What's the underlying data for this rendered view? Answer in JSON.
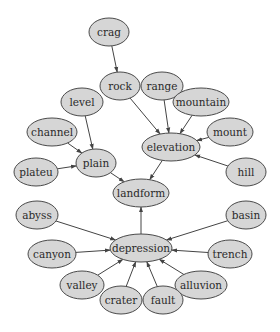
{
  "diagram": {
    "type": "directed-graph",
    "nodes": [
      {
        "id": "crag",
        "label": "crag",
        "x": 109,
        "y": 32,
        "rx": 20,
        "ry": 14
      },
      {
        "id": "rock",
        "label": "rock",
        "x": 120,
        "y": 86,
        "rx": 20,
        "ry": 14
      },
      {
        "id": "range",
        "label": "range",
        "x": 162,
        "y": 86,
        "rx": 21,
        "ry": 14
      },
      {
        "id": "mountain",
        "label": "mountain",
        "x": 201,
        "y": 102,
        "rx": 28,
        "ry": 14
      },
      {
        "id": "level",
        "label": "level",
        "x": 82,
        "y": 102,
        "rx": 21,
        "ry": 14
      },
      {
        "id": "channel",
        "label": "channel",
        "x": 52,
        "y": 132,
        "rx": 25,
        "ry": 14
      },
      {
        "id": "mount",
        "label": "mount",
        "x": 230,
        "y": 132,
        "rx": 23,
        "ry": 14
      },
      {
        "id": "elevation",
        "label": "elevation",
        "x": 171,
        "y": 147,
        "rx": 29,
        "ry": 14
      },
      {
        "id": "plain",
        "label": "plain",
        "x": 96,
        "y": 163,
        "rx": 20,
        "ry": 14
      },
      {
        "id": "plateu",
        "label": "plateu",
        "x": 36,
        "y": 172,
        "rx": 22,
        "ry": 14
      },
      {
        "id": "hill",
        "label": "hill",
        "x": 246,
        "y": 172,
        "rx": 20,
        "ry": 14
      },
      {
        "id": "landform",
        "label": "landform",
        "x": 141,
        "y": 193,
        "rx": 28,
        "ry": 14
      },
      {
        "id": "abyss",
        "label": "abyss",
        "x": 37,
        "y": 215,
        "rx": 21,
        "ry": 14
      },
      {
        "id": "basin",
        "label": "basin",
        "x": 246,
        "y": 215,
        "rx": 20,
        "ry": 14
      },
      {
        "id": "depression",
        "label": "depression",
        "x": 141,
        "y": 248,
        "rx": 31,
        "ry": 14
      },
      {
        "id": "canyon",
        "label": "canyon",
        "x": 52,
        "y": 254,
        "rx": 24,
        "ry": 14
      },
      {
        "id": "trench",
        "label": "trench",
        "x": 230,
        "y": 254,
        "rx": 22,
        "ry": 14
      },
      {
        "id": "valley",
        "label": "valley",
        "x": 82,
        "y": 285,
        "rx": 22,
        "ry": 14
      },
      {
        "id": "alluvion",
        "label": "alluvion",
        "x": 201,
        "y": 285,
        "rx": 26,
        "ry": 14
      },
      {
        "id": "crater",
        "label": "crater",
        "x": 121,
        "y": 300,
        "rx": 21,
        "ry": 14
      },
      {
        "id": "fault",
        "label": "fault",
        "x": 163,
        "y": 300,
        "rx": 20,
        "ry": 14
      }
    ],
    "edges": [
      {
        "from": "crag",
        "to": "rock"
      },
      {
        "from": "rock",
        "to": "elevation"
      },
      {
        "from": "range",
        "to": "elevation"
      },
      {
        "from": "mountain",
        "to": "elevation"
      },
      {
        "from": "mount",
        "to": "elevation"
      },
      {
        "from": "hill",
        "to": "elevation"
      },
      {
        "from": "level",
        "to": "plain"
      },
      {
        "from": "channel",
        "to": "plain"
      },
      {
        "from": "plateu",
        "to": "plain"
      },
      {
        "from": "plain",
        "to": "landform"
      },
      {
        "from": "elevation",
        "to": "landform"
      },
      {
        "from": "depression",
        "to": "landform"
      },
      {
        "from": "abyss",
        "to": "depression"
      },
      {
        "from": "basin",
        "to": "depression"
      },
      {
        "from": "canyon",
        "to": "depression"
      },
      {
        "from": "trench",
        "to": "depression"
      },
      {
        "from": "valley",
        "to": "depression"
      },
      {
        "from": "crater",
        "to": "depression"
      },
      {
        "from": "fault",
        "to": "depression"
      },
      {
        "from": "alluvion",
        "to": "depression"
      }
    ]
  }
}
